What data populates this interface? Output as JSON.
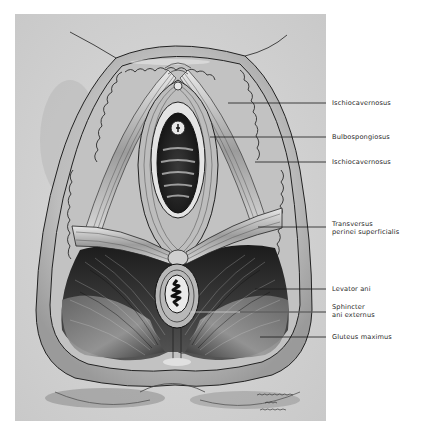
{
  "figure": {
    "panel_color": "#d3d3d3",
    "ink_color": "#1a1a1a"
  },
  "labels": [
    {
      "id": "ischiocavernosus-1",
      "lines": [
        "Ischiocavernosus"
      ],
      "y": 103,
      "line_start_x": 228
    },
    {
      "id": "bulbospongiosus",
      "lines": [
        "Bulbospongiosus"
      ],
      "y": 137,
      "line_start_x": 210
    },
    {
      "id": "ischiocavernosus-2",
      "lines": [
        "Ischiocavernosus"
      ],
      "y": 162,
      "line_start_x": 255
    },
    {
      "id": "transversus-perinei-superficialis",
      "lines": [
        "Transversus",
        "perinei superficialis"
      ],
      "y": 227,
      "line_start_x": 258
    },
    {
      "id": "levator-ani",
      "lines": [
        "Levator ani"
      ],
      "y": 289,
      "line_start_x": 255
    },
    {
      "id": "sphincter-ani-externus",
      "lines": [
        "Sphincter",
        "ani externus"
      ],
      "y": 312,
      "line_start_x": 190
    },
    {
      "id": "gluteus-maximus",
      "lines": [
        "Gluteus maximus"
      ],
      "y": 337,
      "line_start_x": 260
    }
  ],
  "signature": {
    "description": "artist signature (handwritten, illegible)"
  }
}
